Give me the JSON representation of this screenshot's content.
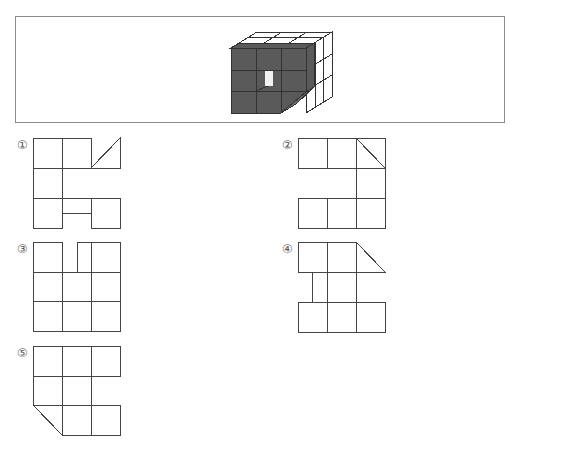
{
  "question": {
    "figure": "3x3x3 cube; front face shaded dark gray with a small white rectangular hole in center cell; a diagonal cut along bottom-right front edge",
    "colors": {
      "shaded": "#5a5a5a",
      "line": "#333333",
      "hole": "#ffffff",
      "frame": "#8a8a8a"
    }
  },
  "options": [
    {
      "label": "①",
      "shape": "net-1"
    },
    {
      "label": "②",
      "shape": "net-2"
    },
    {
      "label": "③",
      "shape": "net-3"
    },
    {
      "label": "④",
      "shape": "net-4"
    },
    {
      "label": "⑤",
      "shape": "net-5"
    }
  ]
}
